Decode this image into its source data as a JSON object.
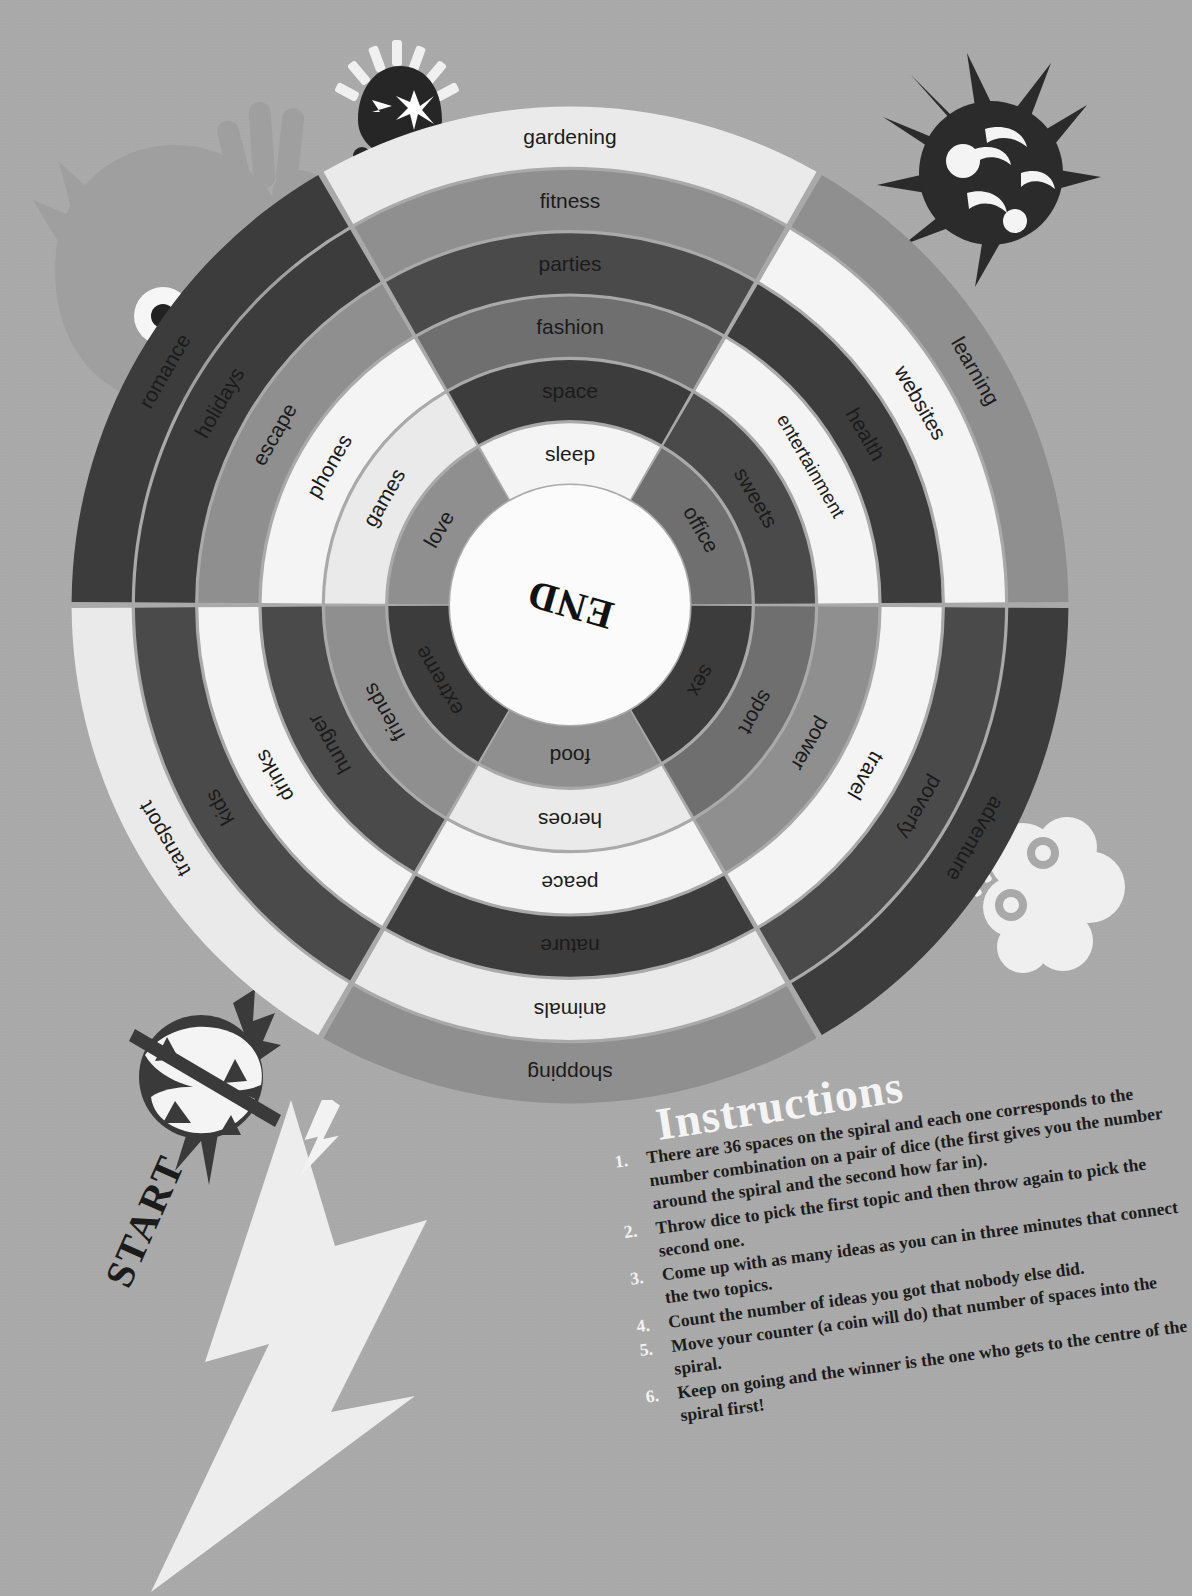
{
  "page": {
    "background_color": "#a9a9a9",
    "start_label": "START",
    "end_label": "END"
  },
  "wheel": {
    "center_label": "END",
    "sectors": 6,
    "rings": 6,
    "total_spaces": 36,
    "ring_colors": [
      "#eaeaea",
      "#8f8f8f",
      "#4a4a4a",
      "#6f6f6f",
      "#3c3c3c",
      "#f4f4f4"
    ],
    "spokes": [
      {
        "name": "north",
        "labels": [
          "gardening",
          "fitness",
          "parties",
          "fashion",
          "space",
          "sleep"
        ],
        "colors": [
          "#eaeaea",
          "#8f8f8f",
          "#4a4a4a",
          "#6f6f6f",
          "#3c3c3c",
          "#f4f4f4"
        ]
      },
      {
        "name": "northeast",
        "labels": [
          "learning",
          "websites",
          "health",
          "entertainment",
          "sweets",
          "office"
        ],
        "colors": [
          "#8f8f8f",
          "#f4f4f4",
          "#3c3c3c",
          "#f4f4f4",
          "#4a4a4a",
          "#6f6f6f"
        ]
      },
      {
        "name": "southeast",
        "labels": [
          "adventure",
          "poverty",
          "travel",
          "power",
          "sport",
          "sex"
        ],
        "colors": [
          "#3c3c3c",
          "#4a4a4a",
          "#f4f4f4",
          "#8f8f8f",
          "#6f6f6f",
          "#3c3c3c"
        ]
      },
      {
        "name": "south",
        "labels": [
          "shopping",
          "animals",
          "nature",
          "peace",
          "heroes",
          "food"
        ],
        "colors": [
          "#8f8f8f",
          "#eaeaea",
          "#3c3c3c",
          "#f4f4f4",
          "#eaeaea",
          "#8f8f8f"
        ]
      },
      {
        "name": "southwest",
        "labels": [
          "transport",
          "kids",
          "drinks",
          "hunger",
          "friends",
          "extreme"
        ],
        "colors": [
          "#eaeaea",
          "#4a4a4a",
          "#f4f4f4",
          "#4a4a4a",
          "#8f8f8f",
          "#3c3c3c"
        ]
      },
      {
        "name": "northwest",
        "labels": [
          "romance",
          "holidays",
          "escape",
          "phones",
          "games",
          "love"
        ],
        "colors": [
          "#3c3c3c",
          "#3c3c3c",
          "#8f8f8f",
          "#f4f4f4",
          "#eaeaea",
          "#8f8f8f"
        ]
      }
    ]
  },
  "instructions": {
    "title": "Instructions",
    "items": [
      {
        "number": "1.",
        "text": "There are 36 spaces on the spiral and each one corresponds to the number combination on a pair of dice (the first gives you the number around the spiral and the second how far in)."
      },
      {
        "number": "2.",
        "text": "Throw dice to pick the first topic and then throw again to pick the second one."
      },
      {
        "number": "3.",
        "text": "Come up with as many ideas as you can in three minutes that connect the two topics."
      },
      {
        "number": "4.",
        "text": "Count the number of ideas you got that nobody else did."
      },
      {
        "number": "5.",
        "text": "Move your counter (a coin will do) that number of spaces into the spiral."
      },
      {
        "number": "6.",
        "text": "Keep on going and the winner is the one who gets to the centre of the spiral first!"
      }
    ]
  },
  "characters": [
    {
      "name": "ghost-monster",
      "color": "#9d9d9d"
    },
    {
      "name": "spark-head-character",
      "color": "#2b2b2b"
    },
    {
      "name": "punk-spiky-character",
      "color": "#2b2b2b"
    },
    {
      "name": "cloud-character",
      "color": "#eeeeee"
    },
    {
      "name": "angry-grin-character",
      "color": "#3a3a3a"
    }
  ]
}
